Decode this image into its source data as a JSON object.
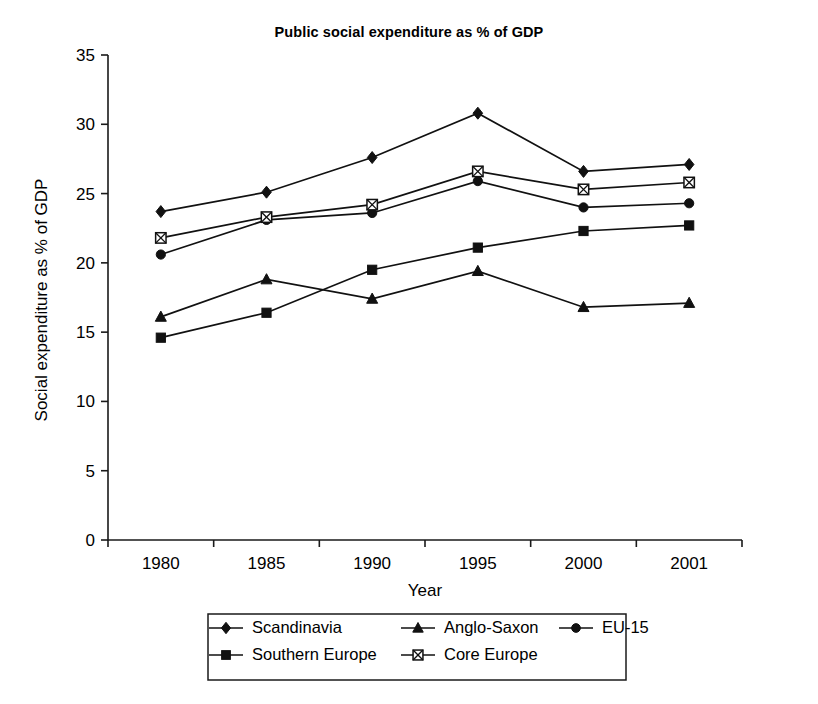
{
  "chart_data": {
    "type": "line",
    "title": "Public social expenditure as % of GDP",
    "xlabel": "Year",
    "ylabel": "Social expenditure as % of GDP",
    "categories": [
      "1980",
      "1985",
      "1990",
      "1995",
      "2000",
      "2001"
    ],
    "ylim": [
      0,
      35
    ],
    "yticks": [
      "0",
      "5",
      "10",
      "15",
      "20",
      "25",
      "30",
      "35"
    ],
    "grid": false,
    "legend_position": "bottom",
    "series": [
      {
        "name": "Scandinavia",
        "marker": "diamond-filled",
        "values": [
          23.7,
          25.1,
          27.6,
          30.8,
          26.6,
          27.1
        ]
      },
      {
        "name": "Anglo-Saxon",
        "marker": "triangle-filled",
        "values": [
          16.1,
          18.8,
          17.4,
          19.4,
          16.8,
          17.1
        ]
      },
      {
        "name": "EU-15",
        "marker": "circle-filled",
        "values": [
          20.6,
          23.1,
          23.6,
          25.9,
          24.0,
          24.3
        ]
      },
      {
        "name": "Southern Europe",
        "marker": "square-filled",
        "values": [
          14.6,
          16.4,
          19.5,
          21.1,
          22.3,
          22.7
        ]
      },
      {
        "name": "Core Europe",
        "marker": "square-crossed",
        "values": [
          21.8,
          23.3,
          24.2,
          26.6,
          25.3,
          25.8
        ]
      }
    ]
  }
}
